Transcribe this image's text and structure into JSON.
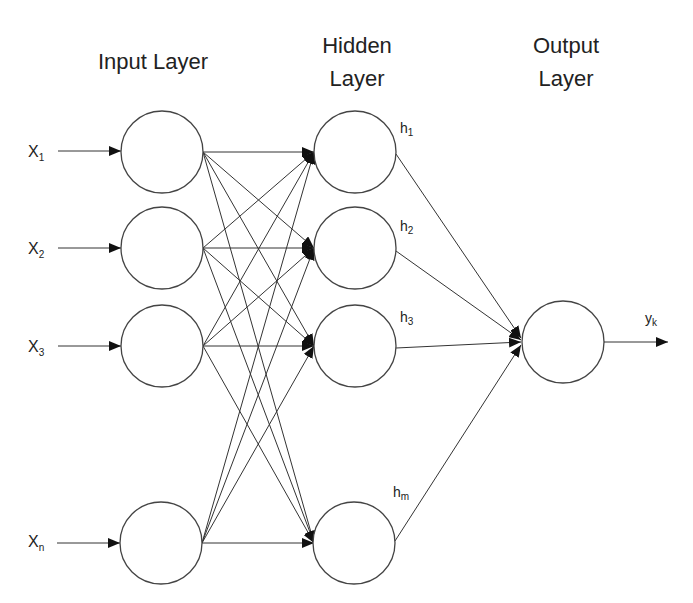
{
  "diagram": {
    "titles": {
      "input": "Input Layer",
      "hidden_line1": "Hidden",
      "hidden_line2": "Layer",
      "output_line1": "Output",
      "output_line2": "Layer"
    },
    "inputs": [
      {
        "base": "X",
        "sub": "1"
      },
      {
        "base": "X",
        "sub": "2"
      },
      {
        "base": "X",
        "sub": "3"
      },
      {
        "base": "X",
        "sub": "n"
      }
    ],
    "hidden": [
      {
        "base": "h",
        "sub": "1"
      },
      {
        "base": "h",
        "sub": "2"
      },
      {
        "base": "h",
        "sub": "3"
      },
      {
        "base": "h",
        "sub": "m"
      }
    ],
    "output": {
      "base": "y",
      "sub": "k"
    },
    "connections": "input layer fully connected to hidden layer; all hidden nodes connect to single output node"
  }
}
